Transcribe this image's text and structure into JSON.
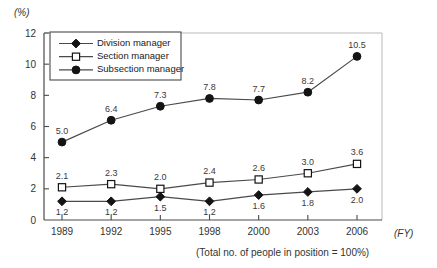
{
  "chart_data": {
    "type": "line",
    "title": "",
    "xlabel": "(FY)",
    "ylabel": "(%)",
    "footnote": "(Total no. of people in position = 100%)",
    "categories": [
      "1989",
      "1992",
      "1995",
      "1998",
      "2000",
      "2003",
      "2006"
    ],
    "ylim": [
      0,
      12
    ],
    "yticks": [
      "0",
      "2",
      "4",
      "6",
      "8",
      "10",
      "12"
    ],
    "ytick_values": [
      0,
      2,
      4,
      6,
      8,
      10,
      12
    ],
    "grid": false,
    "legend_position": "upper-left-inside",
    "series": [
      {
        "name": "Division manager",
        "marker": "filled-diamond",
        "values": [
          1.2,
          1.2,
          1.5,
          1.2,
          1.6,
          1.8,
          2.0
        ],
        "labels": [
          "1.2",
          "1.2",
          "1.5",
          "1.2",
          "1.6",
          "1.8",
          "2.0"
        ],
        "label_pos": [
          "below",
          "below",
          "below",
          "below",
          "below",
          "below",
          "below"
        ],
        "color": "#1a1a1a"
      },
      {
        "name": "Section manager",
        "marker": "open-square",
        "values": [
          2.1,
          2.3,
          2.0,
          2.4,
          2.6,
          3.0,
          3.6
        ],
        "labels": [
          "2.1",
          "2.3",
          "2.0",
          "2.4",
          "2.6",
          "3.0",
          "3.6"
        ],
        "label_pos": [
          "above",
          "above",
          "above",
          "above",
          "above",
          "above",
          "above"
        ],
        "color": "#1a1a1a"
      },
      {
        "name": "Subsection manager",
        "marker": "filled-circle",
        "values": [
          5.0,
          6.4,
          7.3,
          7.8,
          7.7,
          8.2,
          10.5
        ],
        "labels": [
          "5.0",
          "6.4",
          "7.3",
          "7.8",
          "7.7",
          "8.2",
          "10.5"
        ],
        "label_pos": [
          "above",
          "above",
          "above",
          "above",
          "above",
          "above",
          "above"
        ],
        "color": "#1a1a1a"
      }
    ]
  },
  "legend": {
    "items": [
      {
        "label": "Division manager",
        "marker": "filled-diamond"
      },
      {
        "label": "Section manager",
        "marker": "open-square"
      },
      {
        "label": "Subsection manager",
        "marker": "filled-circle"
      }
    ]
  },
  "colors": {
    "axis": "#4a4a4a",
    "line": "#4a4a4a",
    "marker": "#141414",
    "text": "#333333",
    "background": "#ffffff"
  }
}
